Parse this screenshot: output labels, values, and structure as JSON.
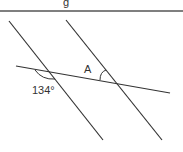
{
  "diagram": {
    "type": "geometry-parallel-lines-transversal",
    "header_rule": {
      "y": 11,
      "color": "#555555"
    },
    "cropped_heading_glyph": "g",
    "lines": [
      {
        "name": "parallel-line-left",
        "x1": 9,
        "y1": 21,
        "x2": 103,
        "y2": 140
      },
      {
        "name": "parallel-line-right",
        "x1": 66,
        "y1": 20,
        "x2": 162,
        "y2": 140
      },
      {
        "name": "transversal",
        "x1": 16,
        "y1": 66,
        "x2": 170,
        "y2": 93
      }
    ],
    "labels": {
      "known_angle": "134°",
      "unknown_angle": "A"
    },
    "stroke_color": "#333333"
  }
}
